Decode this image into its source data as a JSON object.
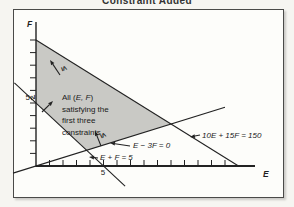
{
  "title": "Constraint Added",
  "figure": {
    "axis_letters": {
      "x": "E",
      "y": "F"
    },
    "tick_labels": {
      "x5": "5",
      "y5": "5"
    },
    "region_label": {
      "line1_pre": "All (",
      "line1_vars": "E, F",
      "line1_post": ")",
      "line2": "satisfying the",
      "line3": "first three",
      "line4": "constraints"
    },
    "inequalities": {
      "upper": "≤",
      "left": "≥",
      "lower": "≤"
    },
    "line_labels": {
      "slope_line": "E − 3F = 0",
      "sum_line": "E + F = 5",
      "new_constraint": "10E + 15F = 150"
    }
  },
  "chart_data": {
    "type": "line",
    "title": "Constraint Added",
    "xlabel": "E",
    "ylabel": "F",
    "xlim": [
      -1.7,
      16.2
    ],
    "ylim": [
      -0.6,
      11.4
    ],
    "grid": false,
    "x_ticks": {
      "from": 1,
      "to": 14,
      "step": 1,
      "labeled": [
        5
      ]
    },
    "y_ticks": {
      "from": 1,
      "to": 10,
      "step": 1,
      "labeled": [
        5
      ]
    },
    "lines": [
      {
        "label": "10E + 15F = 150",
        "from": [
          0,
          10
        ],
        "to": [
          15,
          0
        ]
      },
      {
        "label": "E + F = 5",
        "from": [
          -1.6,
          6.6
        ],
        "to": [
          6.6,
          -1.6
        ]
      },
      {
        "label": "E − 3F = 0",
        "from": [
          -1.7,
          -0.567
        ],
        "to": [
          14,
          4.667
        ]
      }
    ],
    "shaded_region": {
      "description": "All (E, F) satisfying the first three constraints",
      "vertices": [
        [
          0,
          5
        ],
        [
          0,
          10
        ],
        [
          10,
          3.333
        ],
        [
          3.75,
          1.25
        ]
      ],
      "fill": "#c9c9c5"
    },
    "annotations": [
      {
        "symbol": "≤",
        "constraint": "10E + 15F = 150"
      },
      {
        "symbol": "≥",
        "constraint": "E + F = 5"
      },
      {
        "symbol": "≤",
        "constraint": "E − 3F = 0"
      }
    ],
    "ink_color": "#222222"
  }
}
